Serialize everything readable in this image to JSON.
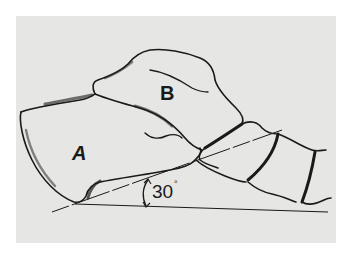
{
  "figure": {
    "type": "anatomical line drawing",
    "labels": {
      "bone_a": "A",
      "bone_b": "B"
    },
    "angle": {
      "value": "30",
      "unit": "°",
      "display": "30°"
    },
    "colors": {
      "background": "#e6e6e4",
      "outline": "#1a1a1a",
      "page": "#ffffff"
    }
  }
}
